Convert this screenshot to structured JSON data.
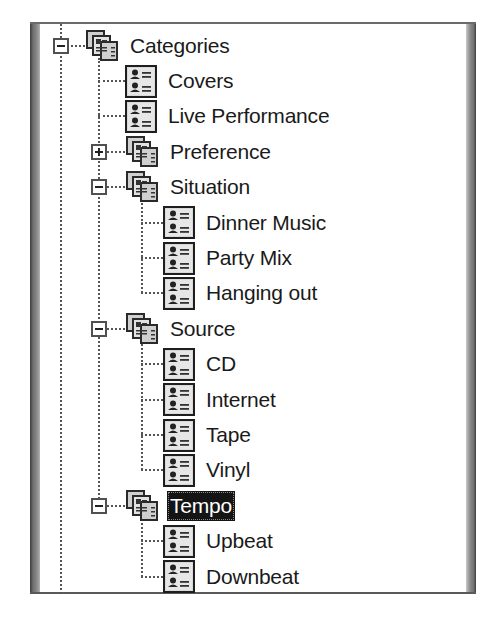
{
  "tree": {
    "nodes": [
      {
        "label": "Categories",
        "level": 0,
        "type": "group",
        "expander": "collapse",
        "selected": false
      },
      {
        "label": "Covers",
        "level": 1,
        "type": "item",
        "expander": null,
        "selected": false
      },
      {
        "label": "Live Performance",
        "level": 1,
        "type": "item",
        "expander": null,
        "selected": false
      },
      {
        "label": "Preference",
        "level": 1,
        "type": "group",
        "expander": "expand",
        "selected": false
      },
      {
        "label": "Situation",
        "level": 1,
        "type": "group",
        "expander": "collapse",
        "selected": false
      },
      {
        "label": "Dinner Music",
        "level": 2,
        "type": "item",
        "expander": null,
        "selected": false
      },
      {
        "label": "Party Mix",
        "level": 2,
        "type": "item",
        "expander": null,
        "selected": false
      },
      {
        "label": "Hanging out",
        "level": 2,
        "type": "item",
        "expander": null,
        "selected": false
      },
      {
        "label": "Source",
        "level": 1,
        "type": "group",
        "expander": "collapse",
        "selected": false
      },
      {
        "label": "CD",
        "level": 2,
        "type": "item",
        "expander": null,
        "selected": false
      },
      {
        "label": "Internet",
        "level": 2,
        "type": "item",
        "expander": null,
        "selected": false
      },
      {
        "label": "Tape",
        "level": 2,
        "type": "item",
        "expander": null,
        "selected": false
      },
      {
        "label": "Vinyl",
        "level": 2,
        "type": "item",
        "expander": null,
        "selected": false
      },
      {
        "label": "Tempo",
        "level": 1,
        "type": "group",
        "expander": "collapse",
        "selected": true
      },
      {
        "label": "Upbeat",
        "level": 2,
        "type": "item",
        "expander": null,
        "selected": false
      },
      {
        "label": "Downbeat",
        "level": 2,
        "type": "item",
        "expander": null,
        "selected": false
      }
    ]
  },
  "icons": {
    "group": "category-group-icon",
    "item": "contact-list-icon",
    "expand": "plus-box-icon",
    "collapse": "minus-box-icon"
  },
  "colors": {
    "selection_bg": "#141414",
    "selection_text": "#ffffff",
    "text": "#1a1a1a",
    "lines": "#555555"
  }
}
